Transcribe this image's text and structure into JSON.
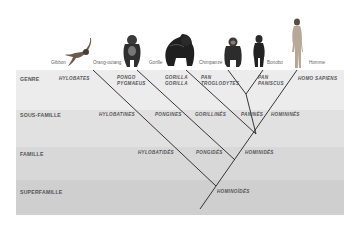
{
  "species": [
    {
      "name": "Gibbon",
      "icon": "gibbon-icon"
    },
    {
      "name": "Orang-outang",
      "icon": "orangutan-icon"
    },
    {
      "name": "Gorille",
      "icon": "gorilla-icon"
    },
    {
      "name": "Chimpanzé",
      "icon": "chimpanzee-icon"
    },
    {
      "name": "Bonobo",
      "icon": "bonobo-icon"
    },
    {
      "name": "Homme",
      "icon": "human-icon"
    }
  ],
  "ranks": {
    "genre": "GENRE",
    "sous_famille": "SOUS-FAMILLE",
    "famille": "FAMILLE",
    "superfamille": "SUPERFAMILLE"
  },
  "genre": {
    "hylobates": "HYLOBATES",
    "pongo_1": "PONGO",
    "pongo_2": "PYGMAEUS",
    "gorilla_1": "GORILLA",
    "gorilla_2": "GORILLA",
    "pan_trog_1": "PAN",
    "pan_trog_2": "TROGLODYTES",
    "pan_pan_1": "PAN",
    "pan_pan_2": "PANISCUS",
    "homo": "HOMO SAPIENS"
  },
  "sous_famille": {
    "hylobatines": "HYLOBATINES",
    "pongines": "PONGINES",
    "gorillines": "GORILLINÉS",
    "panines": "PANINÉS",
    "hominines": "HOMININÉS"
  },
  "famille": {
    "hylobatides": "HYLOBATIDÉS",
    "pongides": "PONGIDÉS",
    "hominides": "HOMINIDÉS"
  },
  "superfamille": {
    "hominoides": "HOMINOÏDÉS"
  },
  "colors": {
    "band_genre": "#ececec",
    "band_sous_famille": "#e0e0e0",
    "band_famille": "#d6d6d6",
    "band_superfamille": "#cdcdcd",
    "line": "#222222"
  }
}
